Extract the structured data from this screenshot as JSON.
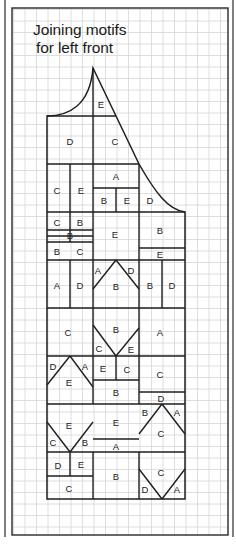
{
  "title": {
    "line1": "Joining motifs",
    "line2": "for left front"
  },
  "colors": {
    "background": "#ffffff",
    "grid": "#d6d6d6",
    "ink": "#1e1e1e",
    "frame": "#2a2a2a"
  },
  "grid": {
    "x0": 12,
    "y0": 8,
    "x1": 228,
    "y1": 535,
    "cell": 11.5
  },
  "frame": {
    "outer_left_x": 5,
    "outer_right_x": 233,
    "inner": {
      "x": 12,
      "y": 8,
      "w": 216,
      "h": 527
    }
  },
  "shape": {
    "peak": [
      93,
      68
    ],
    "outline_path": "M47,116 C68,116 90,106 93,68 L139,164 C155,192 168,210 185,212 L185,499 L47,499 Z"
  },
  "lines": [
    [
      93,
      68,
      93,
      116
    ],
    [
      47,
      116,
      116,
      116
    ],
    [
      93,
      116,
      93,
      212
    ],
    [
      47,
      164,
      139,
      164
    ],
    [
      70,
      164,
      70,
      242
    ],
    [
      93,
      188,
      139,
      188
    ],
    [
      116,
      188,
      116,
      212
    ],
    [
      139,
      164,
      139,
      212
    ],
    [
      47,
      212,
      185,
      212
    ],
    [
      47,
      230,
      93,
      230
    ],
    [
      47,
      236,
      93,
      236
    ],
    [
      47,
      242,
      93,
      242
    ],
    [
      93,
      212,
      93,
      308
    ],
    [
      139,
      212,
      139,
      308
    ],
    [
      139,
      248,
      185,
      248
    ],
    [
      47,
      260,
      185,
      260
    ],
    [
      70,
      260,
      70,
      308
    ],
    [
      162,
      260,
      162,
      308
    ],
    [
      47,
      308,
      185,
      308
    ],
    [
      93,
      308,
      93,
      404
    ],
    [
      139,
      308,
      139,
      404
    ],
    [
      47,
      356,
      185,
      356
    ],
    [
      116,
      356,
      116,
      380
    ],
    [
      93,
      380,
      139,
      380
    ],
    [
      139,
      392,
      185,
      392
    ],
    [
      47,
      404,
      185,
      404
    ],
    [
      93,
      439,
      139,
      439
    ],
    [
      47,
      452,
      185,
      452
    ],
    [
      70,
      452,
      70,
      476
    ],
    [
      47,
      476,
      93,
      476
    ],
    [
      93,
      452,
      93,
      499
    ],
    [
      139,
      452,
      139,
      499
    ]
  ],
  "diagonals": [
    [
      116,
      260,
      93,
      289
    ],
    [
      116,
      260,
      139,
      289
    ],
    [
      93,
      325,
      116,
      356
    ],
    [
      116,
      356,
      139,
      328
    ],
    [
      70,
      356,
      47,
      385
    ],
    [
      70,
      356,
      93,
      387
    ],
    [
      47,
      422,
      70,
      452
    ],
    [
      70,
      452,
      93,
      422
    ],
    [
      162,
      404,
      139,
      434
    ],
    [
      162,
      404,
      185,
      434
    ],
    [
      139,
      469,
      162,
      499
    ],
    [
      162,
      499,
      185,
      469
    ]
  ],
  "labels": [
    {
      "t": "E",
      "x": 101,
      "y": 104
    },
    {
      "t": "D",
      "x": 70,
      "y": 141
    },
    {
      "t": "C",
      "x": 115,
      "y": 141
    },
    {
      "t": "C",
      "x": 57,
      "y": 190
    },
    {
      "t": "E",
      "x": 81,
      "y": 190
    },
    {
      "t": "A",
      "x": 116,
      "y": 176
    },
    {
      "t": "B",
      "x": 104,
      "y": 200
    },
    {
      "t": "E",
      "x": 127,
      "y": 200
    },
    {
      "t": "D",
      "x": 150,
      "y": 200
    },
    {
      "t": "C",
      "x": 57,
      "y": 222
    },
    {
      "t": "B",
      "x": 80,
      "y": 222
    },
    {
      "t": "B",
      "x": 70,
      "y": 235
    },
    {
      "t": "E",
      "x": 115,
      "y": 234
    },
    {
      "t": "B",
      "x": 160,
      "y": 230
    },
    {
      "t": "B",
      "x": 57,
      "y": 251
    },
    {
      "t": "C",
      "x": 80,
      "y": 251
    },
    {
      "t": "E",
      "x": 160,
      "y": 254
    },
    {
      "t": "A",
      "x": 98,
      "y": 270
    },
    {
      "t": "D",
      "x": 131,
      "y": 270
    },
    {
      "t": "B",
      "x": 116,
      "y": 286
    },
    {
      "t": "A",
      "x": 57,
      "y": 285
    },
    {
      "t": "D",
      "x": 80,
      "y": 285
    },
    {
      "t": "B",
      "x": 150,
      "y": 285
    },
    {
      "t": "D",
      "x": 172,
      "y": 285
    },
    {
      "t": "C",
      "x": 68,
      "y": 332
    },
    {
      "t": "B",
      "x": 116,
      "y": 329
    },
    {
      "t": "C",
      "x": 99,
      "y": 348
    },
    {
      "t": "E",
      "x": 131,
      "y": 349
    },
    {
      "t": "A",
      "x": 160,
      "y": 332
    },
    {
      "t": "D",
      "x": 53,
      "y": 366
    },
    {
      "t": "A",
      "x": 85,
      "y": 366
    },
    {
      "t": "E",
      "x": 69,
      "y": 382
    },
    {
      "t": "E",
      "x": 103,
      "y": 368
    },
    {
      "t": "C",
      "x": 127,
      "y": 369
    },
    {
      "t": "C",
      "x": 160,
      "y": 374
    },
    {
      "t": "B",
      "x": 116,
      "y": 392
    },
    {
      "t": "D",
      "x": 161,
      "y": 398
    },
    {
      "t": "B",
      "x": 145,
      "y": 412
    },
    {
      "t": "A",
      "x": 177,
      "y": 412
    },
    {
      "t": "E",
      "x": 69,
      "y": 425
    },
    {
      "t": "E",
      "x": 116,
      "y": 422
    },
    {
      "t": "C",
      "x": 161,
      "y": 433
    },
    {
      "t": "C",
      "x": 53,
      "y": 442
    },
    {
      "t": "B",
      "x": 85,
      "y": 442
    },
    {
      "t": "A",
      "x": 116,
      "y": 446
    },
    {
      "t": "D",
      "x": 58,
      "y": 465
    },
    {
      "t": "E",
      "x": 81,
      "y": 464
    },
    {
      "t": "B",
      "x": 116,
      "y": 476
    },
    {
      "t": "C",
      "x": 161,
      "y": 472
    },
    {
      "t": "C",
      "x": 69,
      "y": 488
    },
    {
      "t": "D",
      "x": 145,
      "y": 489
    },
    {
      "t": "A",
      "x": 177,
      "y": 489
    }
  ]
}
